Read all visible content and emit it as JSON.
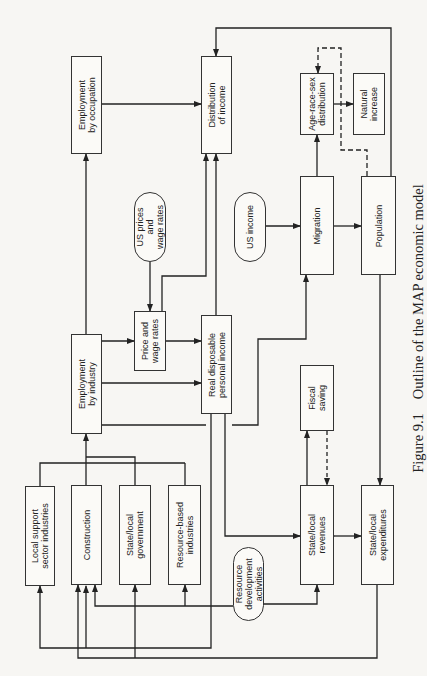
{
  "figure": {
    "number": "Figure 9.1",
    "title": "Outline of the MAP economic model"
  },
  "nodes": {
    "employment_by_occupation": "Employment\nby occupation",
    "distribution_of_income": "Distribution\nof income",
    "age_race_sex_distribution": "Age-race-sex\ndistribution",
    "natural_increase": "Natural\nincrease",
    "us_prices_and_wage_rates": "US prices\nand\nwage rates",
    "us_income": "US income",
    "migration": "Migration",
    "population": "Population",
    "employment_by_industry": "Employment\nby industry",
    "price_and_wage_rates": "Price and\nwage rates",
    "real_disposable_personal_income": "Real disposable\npersonal income",
    "fiscal_saving": "Fiscal\nsaving",
    "local_support_sector_industries": "Local support\nsector industries",
    "construction": "Construction",
    "state_local_government": "State/local\ngovernment",
    "resource_based_industries": "Resource-based\nindustries",
    "resource_development_activities": "Resource\ndevelopment\nactivities",
    "state_local_revenues": "State/local\nrevenues",
    "state_local_expenditures": "State/local\nexpenditures"
  },
  "node_shapes": {
    "rectangle": [
      "employment_by_occupation",
      "distribution_of_income",
      "age_race_sex_distribution",
      "natural_increase",
      "migration",
      "population",
      "employment_by_industry",
      "price_and_wage_rates",
      "real_disposable_personal_income",
      "fiscal_saving",
      "local_support_sector_industries",
      "construction",
      "state_local_government",
      "resource_based_industries",
      "state_local_revenues",
      "state_local_expenditures"
    ],
    "oval_exogenous": [
      "us_prices_and_wage_rates",
      "us_income",
      "resource_development_activities"
    ]
  },
  "edges": [
    {
      "from": "employment_by_occupation",
      "to": "distribution_of_income",
      "style": "solid"
    },
    {
      "from": "employment_by_industry",
      "to": "employment_by_occupation",
      "style": "solid"
    },
    {
      "from": "employment_by_industry",
      "to": "price_and_wage_rates",
      "style": "solid"
    },
    {
      "from": "employment_by_industry",
      "to": "real_disposable_personal_income",
      "style": "solid"
    },
    {
      "from": "employment_by_industry",
      "to": "state_local_revenues",
      "style": "solid"
    },
    {
      "from": "us_prices_and_wage_rates",
      "to": "price_and_wage_rates",
      "style": "solid"
    },
    {
      "from": "price_and_wage_rates",
      "to": "real_disposable_personal_income",
      "style": "solid"
    },
    {
      "from": "price_and_wage_rates",
      "to": "distribution_of_income",
      "style": "solid"
    },
    {
      "from": "real_disposable_personal_income",
      "to": "distribution_of_income",
      "style": "solid"
    },
    {
      "from": "real_disposable_personal_income",
      "to": "migration",
      "style": "solid"
    },
    {
      "from": "real_disposable_personal_income",
      "to": "construction",
      "style": "solid"
    },
    {
      "from": "real_disposable_personal_income",
      "to": "local_support_sector_industries",
      "style": "solid"
    },
    {
      "from": "us_income",
      "to": "migration",
      "style": "solid"
    },
    {
      "from": "migration",
      "to": "population",
      "style": "solid"
    },
    {
      "from": "migration",
      "to": "age_race_sex_distribution",
      "style": "solid"
    },
    {
      "from": "age_race_sex_distribution",
      "to": "natural_increase",
      "style": "solid"
    },
    {
      "from": "population",
      "to": "age_race_sex_distribution",
      "style": "dashed"
    },
    {
      "from": "population",
      "to": "distribution_of_income",
      "style": "solid"
    },
    {
      "from": "population",
      "to": "state_local_expenditures",
      "style": "solid"
    },
    {
      "from": "local_support_sector_industries",
      "to": "employment_by_industry",
      "style": "solid"
    },
    {
      "from": "construction",
      "to": "employment_by_industry",
      "style": "solid"
    },
    {
      "from": "state_local_government",
      "to": "employment_by_industry",
      "style": "solid"
    },
    {
      "from": "resource_based_industries",
      "to": "employment_by_industry",
      "style": "solid"
    },
    {
      "from": "resource_development_activities",
      "to": "state_local_revenues",
      "style": "solid"
    },
    {
      "from": "resource_development_activities",
      "to": "resource_based_industries",
      "style": "solid"
    },
    {
      "from": "resource_development_activities",
      "to": "construction",
      "style": "solid"
    },
    {
      "from": "state_local_revenues",
      "to": "fiscal_saving",
      "style": "solid"
    },
    {
      "from": "fiscal_saving",
      "to": "state_local_revenues",
      "style": "dashed"
    },
    {
      "from": "state_local_revenues",
      "to": "state_local_expenditures",
      "style": "solid-bidirectional"
    },
    {
      "from": "state_local_expenditures",
      "to": "state_local_government",
      "style": "solid"
    },
    {
      "from": "state_local_expenditures",
      "to": "construction",
      "style": "solid"
    }
  ],
  "orientation": "rotated 90 degrees counter-clockwise (text reads bottom-to-top)"
}
